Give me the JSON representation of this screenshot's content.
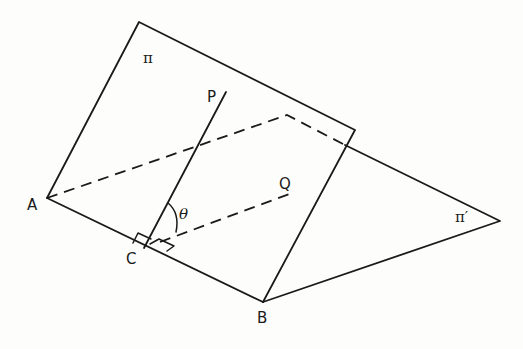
{
  "diagram": {
    "labels": {
      "plane_1": "π",
      "plane_2": "π′",
      "point_A": "A",
      "point_B": "B",
      "point_C": "C",
      "point_P": "P",
      "point_Q": "Q",
      "angle": "θ"
    },
    "edges": [
      {
        "from": "A",
        "to": "B",
        "style": "solid",
        "note": "line of intersection"
      },
      {
        "from": "C",
        "to": "P",
        "style": "solid"
      },
      {
        "from": "C",
        "to": "Q",
        "style": "dashed"
      },
      {
        "from": "A",
        "to": "π′ far corner",
        "style": "dashed",
        "note": "hidden edge of plane π′"
      }
    ],
    "right_angle_marks": [
      "PCA",
      "QCB"
    ]
  }
}
